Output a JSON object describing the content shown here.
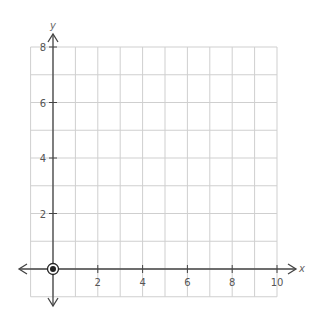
{
  "chart_data": {
    "type": "scatter",
    "title": "",
    "xlabel": "x",
    "ylabel": "y",
    "xlim": [
      -1,
      10
    ],
    "ylim": [
      -1,
      8
    ],
    "x_ticks": [
      2,
      4,
      6,
      8,
      10
    ],
    "y_ticks": [
      2,
      4,
      6,
      8
    ],
    "x_tick_labels": [
      "2",
      "4",
      "6",
      "8",
      "10"
    ],
    "y_tick_labels": [
      "2",
      "4",
      "6",
      "8"
    ],
    "grid": true,
    "grid_step": 1,
    "legend": null,
    "points": [
      {
        "x": 0,
        "y": 0,
        "style": "circled-dot"
      }
    ],
    "colors": {
      "grid": "#cfcfcf",
      "axis": "#444444",
      "point": "#222222"
    }
  }
}
